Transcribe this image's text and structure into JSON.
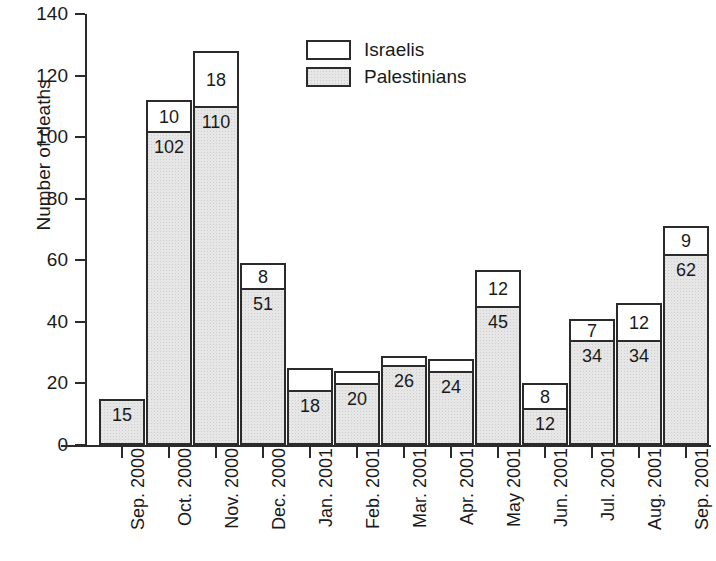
{
  "chart_data": {
    "type": "bar",
    "subtype": "stacked-bar",
    "title": "",
    "xlabel": "",
    "ylabel": "Number of deaths",
    "ylim": [
      0,
      140
    ],
    "ytick_step": 20,
    "yticks": [
      0,
      20,
      40,
      60,
      80,
      100,
      120,
      140
    ],
    "ytick_labels": [
      "0",
      "20",
      "40",
      "60",
      "80",
      "100",
      "120",
      "140"
    ],
    "grid": false,
    "legend_position": "top-center",
    "categories": [
      "Sep. 2000",
      "Oct. 2000",
      "Nov. 2000",
      "Dec. 2000",
      "Jan. 2001",
      "Feb. 2001",
      "Mar. 2001",
      "Apr. 2001",
      "May 2001",
      "Jun. 2001",
      "Jul. 2001",
      "Aug. 2001",
      "Sep. 2001"
    ],
    "series": [
      {
        "name": "Palestinians",
        "color": "#e6e6e6",
        "fill": "stippled-gray",
        "values": [
          15,
          102,
          110,
          51,
          18,
          20,
          26,
          24,
          45,
          12,
          34,
          34,
          62
        ],
        "value_labels": [
          "15",
          "102",
          "110",
          "51",
          "18",
          "20",
          "26",
          "24",
          "45",
          "12",
          "34",
          "34",
          "62"
        ]
      },
      {
        "name": "Israelis",
        "color": "#ffffff",
        "fill": "white",
        "values": [
          0,
          10,
          18,
          8,
          7,
          4,
          3,
          4,
          12,
          8,
          7,
          12,
          9
        ],
        "value_labels": [
          "",
          "10",
          "18",
          "8",
          "",
          "",
          "",
          "",
          "12",
          "8",
          "7",
          "12",
          "9"
        ]
      }
    ],
    "totals": [
      15,
      112,
      128,
      59,
      25,
      24,
      29,
      28,
      57,
      20,
      41,
      46,
      71
    ]
  },
  "legend": {
    "entries": [
      {
        "label": "Israelis",
        "swatch": "white-box"
      },
      {
        "label": "Palestinians",
        "swatch": "gray-stippled-box"
      }
    ]
  },
  "axes": {
    "y_title": "Number of deaths"
  }
}
